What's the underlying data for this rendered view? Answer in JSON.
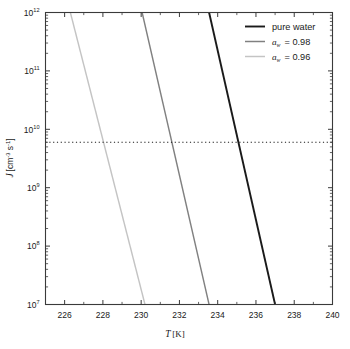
{
  "chart_data": {
    "type": "line",
    "title": "",
    "xlabel": "T [K]",
    "xlabel_symbol": "T",
    "xlabel_unit": "[K]",
    "ylabel": "J [cm^-3 s^-1]",
    "ylabel_symbol": "J",
    "ylabel_unit_cm": "[cm",
    "ylabel_unit_exp1": "-3",
    "ylabel_unit_s": " s",
    "ylabel_unit_exp2": "-1",
    "ylabel_unit_close": "]",
    "xlim": [
      225,
      240
    ],
    "ylim": [
      10000000.0,
      1000000000000.0
    ],
    "yscale": "log",
    "xscale": "linear",
    "grid": false,
    "legend_position": "top-right",
    "xticks": [
      226,
      228,
      230,
      232,
      234,
      236,
      238,
      240
    ],
    "xtick_labels": [
      "226",
      "228",
      "230",
      "232",
      "234",
      "236",
      "238",
      "240"
    ],
    "yticks": [
      10000000.0,
      100000000.0,
      1000000000.0,
      10000000000.0,
      100000000000.0,
      1000000000000.0
    ],
    "ytick_mantissa": "10",
    "ytick_exponents": [
      "12",
      "11",
      "10",
      "9",
      "8",
      "7"
    ],
    "minor_ticks": true,
    "series": [
      {
        "name": "pure water",
        "color": "#1a1a1a",
        "linewidth": 1.9,
        "x": [
          233.55,
          237.0
        ],
        "y": [
          1000000000000.0,
          10000000.0
        ]
      },
      {
        "name": "a_w = 0.98",
        "color": "#808080",
        "linewidth": 1.4,
        "x": [
          230.05,
          233.55
        ],
        "y": [
          1000000000000.0,
          10000000.0
        ]
      },
      {
        "name": "a_w = 0.96",
        "color": "#c4c4c4",
        "linewidth": 1.4,
        "x": [
          226.3,
          230.2
        ],
        "y": [
          1000000000000.0,
          10000000.0
        ]
      }
    ],
    "reference_line": {
      "type": "horizontal-dotted",
      "y": 6000000000.0,
      "color": "#1a1a1a",
      "style": "dotted"
    },
    "annotations": []
  },
  "legend": {
    "entries": [
      {
        "label": "pure water",
        "symbol": "",
        "subscript": "",
        "value": "",
        "color": "#1a1a1a"
      },
      {
        "label": "",
        "symbol": "a",
        "subscript": "w",
        "value": " = 0.98",
        "color": "#808080"
      },
      {
        "label": "",
        "symbol": "a",
        "subscript": "w",
        "value": " = 0.96",
        "color": "#c4c4c4"
      }
    ]
  }
}
